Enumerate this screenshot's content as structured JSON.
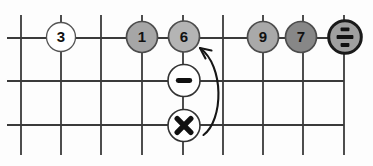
{
  "figure": {
    "type": "grid-operator-diagram",
    "grid": {
      "vertical_lines": 9,
      "horizontal_lines": 3
    }
  },
  "colors": {
    "background": "#fdfdfd",
    "grid_line": "#3a3a3a",
    "arrow": "#161616",
    "label_text": "#111111"
  },
  "nodes": [
    {
      "id": "node-3",
      "kind": "number",
      "label": "3",
      "fill": "#ffffff"
    },
    {
      "id": "node-1",
      "kind": "number",
      "label": "1",
      "fill": "#a6a6a6"
    },
    {
      "id": "node-6",
      "kind": "number",
      "label": "6",
      "fill": "#b4b4b4"
    },
    {
      "id": "node-9",
      "kind": "number",
      "label": "9",
      "fill": "#a9a9a9"
    },
    {
      "id": "node-7",
      "kind": "number",
      "label": "7",
      "fill": "#878787"
    },
    {
      "id": "node-divide",
      "kind": "operator",
      "label": "÷",
      "fill": "#a0a0a0"
    },
    {
      "id": "node-minus",
      "kind": "operator",
      "label": "−",
      "fill": "#ffffff"
    },
    {
      "id": "node-multiply",
      "kind": "operator",
      "label": "×",
      "fill": "#ffffff"
    }
  ],
  "annotation": {
    "arrow_from": "node-multiply",
    "arrow_to": "node-6"
  }
}
